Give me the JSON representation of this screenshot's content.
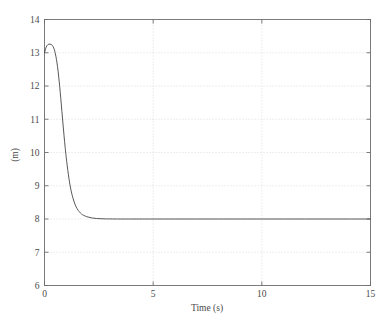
{
  "chart_data": {
    "type": "line",
    "title": "",
    "xlabel": "Time (s)",
    "ylabel": "(m)",
    "xlim": [
      0,
      15
    ],
    "ylim": [
      6,
      14
    ],
    "xticks": [
      0,
      5,
      10,
      15
    ],
    "xtick_labels": [
      "0",
      "5",
      "10",
      "15"
    ],
    "yticks": [
      6,
      7,
      8,
      9,
      10,
      11,
      12,
      13,
      14
    ],
    "ytick_labels": [
      "6",
      "7",
      "8",
      "9",
      "10",
      "11",
      "12",
      "13",
      "14"
    ],
    "grid": true,
    "grid_style": "dotted",
    "legend": null,
    "line_color": "#444444",
    "series": [
      {
        "name": "response",
        "x": [
          0.0,
          0.05,
          0.1,
          0.15,
          0.2,
          0.25,
          0.3,
          0.35,
          0.4,
          0.45,
          0.5,
          0.55,
          0.6,
          0.65,
          0.7,
          0.75,
          0.8,
          0.85,
          0.9,
          0.95,
          1.0,
          1.1,
          1.2,
          1.3,
          1.4,
          1.5,
          1.6,
          1.7,
          1.8,
          1.9,
          2.0,
          2.2,
          2.4,
          2.6,
          2.8,
          3.0,
          3.25,
          3.5,
          4.0,
          4.5,
          5.0,
          6.0,
          7.0,
          8.0,
          9.0,
          10.0,
          11.0,
          12.0,
          13.0,
          14.0,
          15.0
        ],
        "y": [
          13.0,
          13.12,
          13.2,
          13.24,
          13.26,
          13.26,
          13.25,
          13.23,
          13.18,
          13.1,
          12.97,
          12.8,
          12.58,
          12.3,
          11.98,
          11.62,
          11.24,
          10.86,
          10.5,
          10.16,
          9.85,
          9.33,
          8.93,
          8.65,
          8.45,
          8.31,
          8.22,
          8.15,
          8.11,
          8.08,
          8.06,
          8.03,
          8.015,
          8.008,
          8.004,
          8.002,
          8.001,
          8.0,
          8.0,
          8.0,
          8.0,
          8.0,
          8.0,
          8.0,
          8.0,
          8.0,
          8.0,
          8.0,
          8.0,
          8.0,
          8.0
        ]
      }
    ]
  },
  "colors": {
    "background": "#ffffff",
    "axis": "#6e6e6e",
    "grid": "#cfcfcf",
    "line": "#444444",
    "text": "#4a4a4a"
  }
}
